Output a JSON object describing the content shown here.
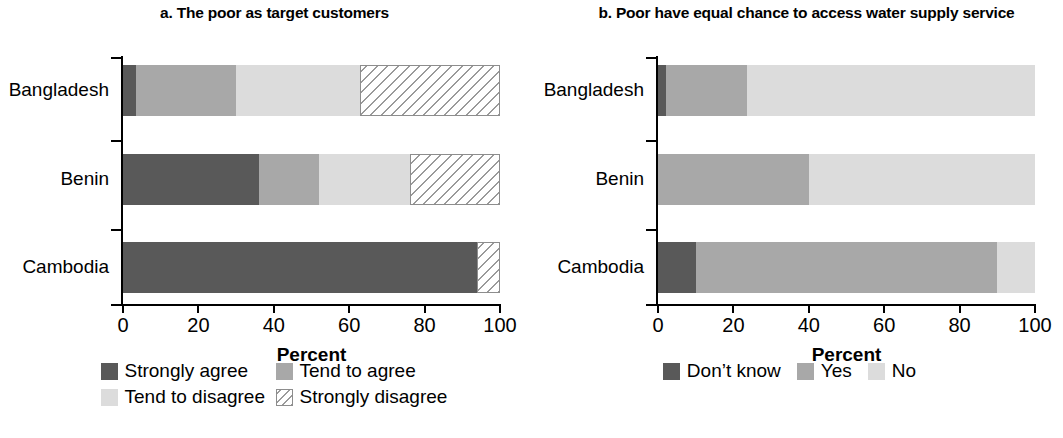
{
  "colors": {
    "strongly_agree": "#595959",
    "tend_to_agree": "#a8a8a8",
    "tend_to_disagree": "#dcdcdc",
    "strongly_disagree": "#ffffff",
    "dont_know": "#595959",
    "yes": "#a8a8a8",
    "no": "#dcdcdc",
    "axis": "#000000"
  },
  "panel_a": {
    "title": "a. The poor as target customers",
    "xlabel": "Percent",
    "xticks": [
      "0",
      "20",
      "40",
      "60",
      "80",
      "100"
    ],
    "categories": [
      "Bangladesh",
      "Benin",
      "Cambodia"
    ],
    "legend": [
      {
        "label": "Strongly agree",
        "style": "solid",
        "color": "#595959"
      },
      {
        "label": "Tend to agree",
        "style": "solid",
        "color": "#a8a8a8"
      },
      {
        "label": "Tend to disagree",
        "style": "solid",
        "color": "#dcdcdc"
      },
      {
        "label": "Strongly disagree",
        "style": "hatch",
        "color": "#ffffff"
      }
    ]
  },
  "panel_b": {
    "title": "b. Poor have equal chance to access water supply service",
    "xlabel": "Percent",
    "xticks": [
      "0",
      "20",
      "40",
      "60",
      "80",
      "100"
    ],
    "categories": [
      "Bangladesh",
      "Benin",
      "Cambodia"
    ],
    "legend": [
      {
        "label": "Don’t know",
        "style": "solid",
        "color": "#595959"
      },
      {
        "label": "Yes",
        "style": "solid",
        "color": "#a8a8a8"
      },
      {
        "label": "No",
        "style": "solid",
        "color": "#dcdcdc"
      }
    ]
  },
  "chart_data": [
    {
      "type": "bar",
      "orientation": "horizontal",
      "stacked": true,
      "title": "a. The poor as target customers",
      "xlabel": "Percent",
      "ylabel": "",
      "xlim": [
        0,
        100
      ],
      "xticks": [
        0,
        20,
        40,
        60,
        80,
        100
      ],
      "grid": false,
      "legend_position": "bottom",
      "categories": [
        "Bangladesh",
        "Benin",
        "Cambodia"
      ],
      "series": [
        {
          "name": "Strongly agree",
          "values": [
            3.5,
            36,
            94
          ]
        },
        {
          "name": "Tend to agree",
          "values": [
            26.5,
            16,
            0
          ]
        },
        {
          "name": "Tend to disagree",
          "values": [
            33,
            24,
            0
          ]
        },
        {
          "name": "Strongly disagree",
          "values": [
            37,
            24,
            6
          ]
        }
      ]
    },
    {
      "type": "bar",
      "orientation": "horizontal",
      "stacked": true,
      "title": "b. Poor have equal chance to access water supply service",
      "xlabel": "Percent",
      "ylabel": "",
      "xlim": [
        0,
        100
      ],
      "xticks": [
        0,
        20,
        40,
        60,
        80,
        100
      ],
      "grid": false,
      "legend_position": "bottom",
      "categories": [
        "Bangladesh",
        "Benin",
        "Cambodia"
      ],
      "series": [
        {
          "name": "Don’t know",
          "values": [
            2,
            0,
            10
          ]
        },
        {
          "name": "Yes",
          "values": [
            21.5,
            40,
            80
          ]
        },
        {
          "name": "No",
          "values": [
            76.5,
            60,
            10
          ]
        }
      ]
    }
  ]
}
